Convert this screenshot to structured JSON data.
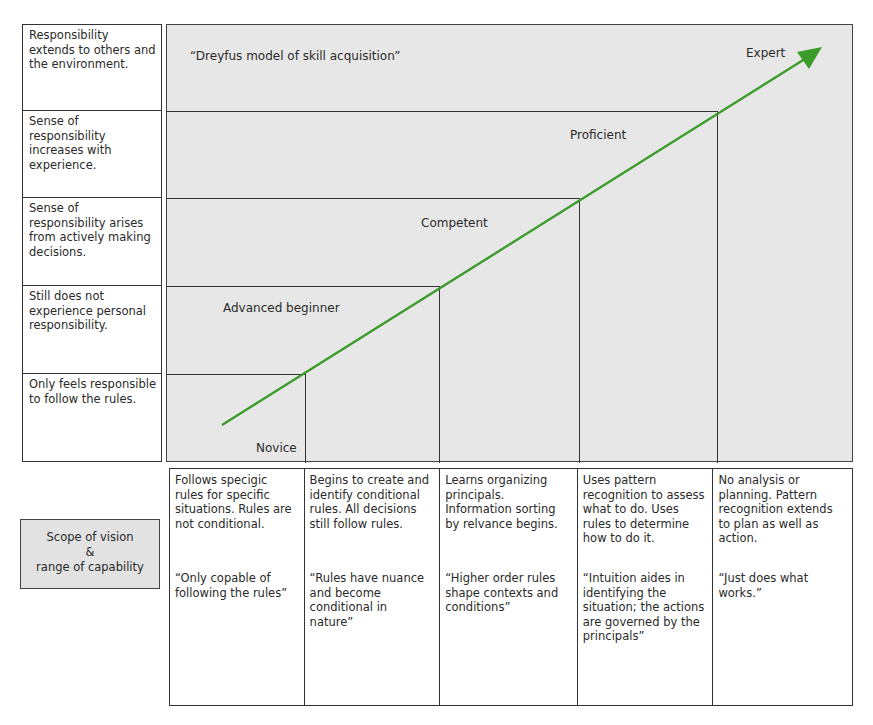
{
  "title": "“Dreyfus model of skill acquisition”",
  "responsibility_column": [
    "Responsibility extends to others and the environment.",
    "Sense of responsibility increases with experience.",
    "Sense of responsibility arises from actively making decisions.",
    "Still does not experience personal responsibility.",
    "Only feels responsible to follow the rules."
  ],
  "stages": [
    {
      "label": "Novice"
    },
    {
      "label": "Advanced beginner"
    },
    {
      "label": "Competent"
    },
    {
      "label": "Proficient"
    },
    {
      "label": "Expert"
    }
  ],
  "arrow": {
    "color": "#3a9a2a",
    "start": [
      222,
      425
    ],
    "end": [
      822,
      48
    ]
  },
  "scope_box": {
    "line1": "Scope of vision",
    "line2": "&",
    "line3": "range of capability"
  },
  "capability_columns": [
    {
      "description": "Follows specigic rules for specific situations. Rules are not conditional.",
      "quote": "“Only copable of following the rules”"
    },
    {
      "description": "Begins to create and identify conditional rules. All decisions still follow rules.",
      "quote": "“Rules have nuance and become conditional in nature”"
    },
    {
      "description": "Learns organizing principals. Information sorting by relvance begins.",
      "quote": "“Higher order rules shape contexts and conditions”"
    },
    {
      "description": "Uses pattern recognition to assess what to do. Uses rules to determine how to do it.",
      "quote": "“Intuition aides in identifying the situation; the actions are governed by the principals”"
    },
    {
      "description": "No analysis or planning. Pattern recognition extends to plan as well as action.",
      "quote": "“Just does what works.”"
    }
  ],
  "colors": {
    "diagram_fill": "#e7e7e7",
    "scope_fill": "#e2e2e2",
    "border": "#333333",
    "arrow": "#3a9a2a"
  }
}
